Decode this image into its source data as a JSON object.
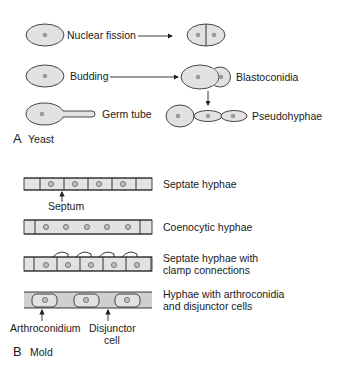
{
  "section_a": {
    "letter": "A",
    "title": "Yeast",
    "rows": [
      {
        "left_label": "Nuclear fission",
        "right_label": ""
      },
      {
        "left_label": "Budding",
        "right_label": "Blastoconidia"
      },
      {
        "left_label": "Germ tube",
        "right_label": "Pseudohyphae"
      }
    ]
  },
  "section_b": {
    "letter": "B",
    "title": "Mold",
    "hyphae": [
      {
        "label_line1": "Septate hyphae",
        "label_line2": "",
        "pointer_label": "Septum"
      },
      {
        "label_line1": "Coenocytic hyphae",
        "label_line2": ""
      },
      {
        "label_line1": "Septate hyphae with",
        "label_line2": "clamp connections"
      },
      {
        "label_line1": "Hyphae with arthroconidia",
        "label_line2": "and disjunctor cells",
        "pointer_labels": [
          "Arthroconidium",
          "Disjunctor",
          "cell"
        ]
      }
    ]
  },
  "colors": {
    "cell_fill": "#e2e2e2",
    "outline": "#333333",
    "nucleus": "#9a9a9a"
  }
}
